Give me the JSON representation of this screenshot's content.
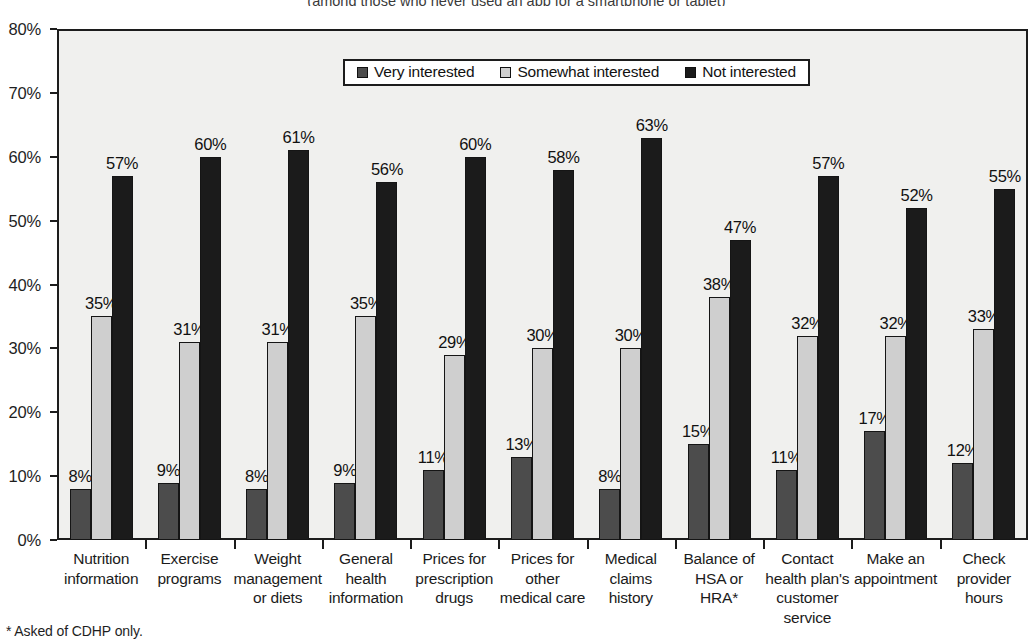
{
  "chart_data": {
    "type": "bar",
    "title": "(among those who never used an app for a smartphone or tablet)",
    "xlabel": "",
    "ylabel": "",
    "ylim": [
      0,
      80
    ],
    "ytick_labels": [
      "0%",
      "10%",
      "20%",
      "30%",
      "40%",
      "50%",
      "60%",
      "70%",
      "80%"
    ],
    "ytick_values": [
      0,
      10,
      20,
      30,
      40,
      50,
      60,
      70,
      80
    ],
    "grid": false,
    "legend_position": "top-center",
    "categories": [
      "Nutrition information",
      "Exercise programs",
      "Weight management or diets",
      "General health information",
      "Prices for prescription drugs",
      "Prices for other medical care",
      "Medical claims history",
      "Balance of HSA or HRA*",
      "Contact health plan's customer service",
      "Make an appointment",
      "Check provider hours"
    ],
    "category_lines": [
      [
        "Nutrition",
        "information"
      ],
      [
        "Exercise",
        "programs"
      ],
      [
        "Weight",
        "management",
        "or diets"
      ],
      [
        "General",
        "health",
        "information"
      ],
      [
        "Prices for",
        "prescription",
        "drugs"
      ],
      [
        "Prices for",
        "other",
        "medical care"
      ],
      [
        "Medical",
        "claims",
        "history"
      ],
      [
        "Balance of",
        "HSA or",
        "HRA*"
      ],
      [
        "Contact",
        "health plan's",
        "customer",
        "service"
      ],
      [
        "Make an",
        "appointment"
      ],
      [
        "Check",
        "provider",
        "hours"
      ]
    ],
    "series": [
      {
        "name": "Very interested",
        "color": "#4c4c4c",
        "values": [
          8,
          9,
          8,
          9,
          11,
          13,
          8,
          15,
          11,
          17,
          12
        ],
        "labels": [
          "8%",
          "9%",
          "8%",
          "9%",
          "11%",
          "13%",
          "8%",
          "15%",
          "11%",
          "17%",
          "12%"
        ]
      },
      {
        "name": "Somewhat interested",
        "color": "#cfcfcf",
        "values": [
          35,
          31,
          31,
          35,
          29,
          30,
          30,
          38,
          32,
          32,
          33
        ],
        "labels": [
          "35%",
          "31%",
          "31%",
          "35%",
          "29%",
          "30%",
          "30%",
          "38%",
          "32%",
          "32%",
          "33%"
        ]
      },
      {
        "name": "Not interested",
        "color": "#1b1b1b",
        "values": [
          57,
          60,
          61,
          56,
          60,
          58,
          63,
          47,
          57,
          52,
          55
        ],
        "labels": [
          "57%",
          "60%",
          "61%",
          "56%",
          "60%",
          "58%",
          "63%",
          "47%",
          "57%",
          "52%",
          "55%"
        ]
      }
    ]
  },
  "legend": {
    "items": [
      {
        "label": "Very interested"
      },
      {
        "label": "Somewhat interested"
      },
      {
        "label": "Not interested"
      }
    ]
  },
  "footnote": {
    "text": "* Asked of CDHP only."
  }
}
